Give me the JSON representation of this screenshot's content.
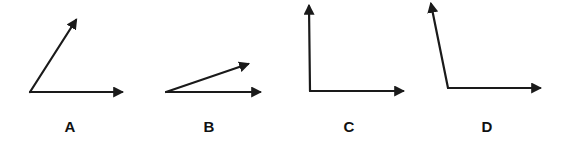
{
  "diagram": {
    "title": "",
    "colors": {
      "stroke": "#1a1a1a",
      "label": "#111111",
      "background": "#ffffff"
    },
    "angles": [
      {
        "id": "A",
        "label": "A",
        "description": "acute angle (~57°)",
        "vertex": [
          30,
          92
        ],
        "rays": [
          {
            "to": [
              122,
              92
            ]
          },
          {
            "to": [
              76,
              20
            ]
          }
        ],
        "label_pos": [
          70,
          132
        ]
      },
      {
        "id": "B",
        "label": "B",
        "description": "acute angle (~19°)",
        "vertex": [
          166,
          92
        ],
        "rays": [
          {
            "to": [
              260,
              92
            ]
          },
          {
            "to": [
              248,
              64
            ]
          }
        ],
        "label_pos": [
          209,
          132
        ]
      },
      {
        "id": "C",
        "label": "C",
        "description": "right angle (90°)",
        "vertex": [
          310,
          91
        ],
        "rays": [
          {
            "to": [
              403,
              91
            ]
          },
          {
            "to": [
              309,
              6
            ]
          }
        ],
        "label_pos": [
          349,
          132
        ]
      },
      {
        "id": "D",
        "label": "D",
        "description": "obtuse angle (~101°)",
        "vertex": [
          448,
          88
        ],
        "rays": [
          {
            "to": [
              540,
              88
            ]
          },
          {
            "to": [
              431,
              4
            ]
          }
        ],
        "label_pos": [
          487,
          132
        ]
      }
    ]
  }
}
